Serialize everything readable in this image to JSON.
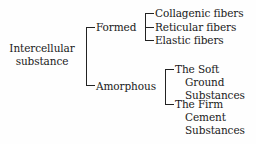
{
  "root": {
    "line1": "Intercellular",
    "line2": "substance"
  },
  "branches": {
    "formed": {
      "label": "Formed",
      "children": [
        "Collagenic fibers",
        "Reticular fibers",
        "Elastic fibers"
      ]
    },
    "amorphous": {
      "label": "Amorphous",
      "children": [
        {
          "lines": [
            "The Soft",
            "Ground",
            "Substances"
          ]
        },
        {
          "lines": [
            "The Firm",
            "Cement",
            "Substances"
          ]
        }
      ]
    }
  }
}
